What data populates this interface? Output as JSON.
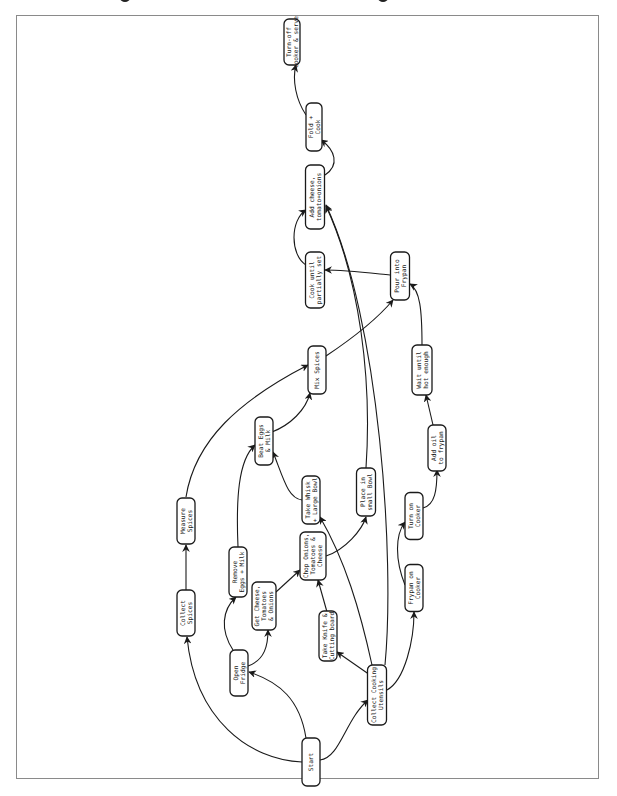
{
  "diagram": {
    "type": "flowchart",
    "orientation": "rotated-90-ccw",
    "title_fragment_visible": false,
    "nodes": [
      {
        "id": "start",
        "label": [
          "Start"
        ],
        "cx": 311,
        "cy": 762,
        "w": 18,
        "h": 48
      },
      {
        "id": "open_fridge",
        "label": [
          "Open",
          "Fridge"
        ],
        "cx": 239,
        "cy": 673,
        "w": 18,
        "h": 46
      },
      {
        "id": "collect_utensils",
        "label": [
          "Collect Cooking",
          "Utensils"
        ],
        "cx": 377,
        "cy": 695,
        "w": 19,
        "h": 60
      },
      {
        "id": "collect_spices",
        "label": [
          "Collect",
          "Spices"
        ],
        "cx": 186,
        "cy": 613,
        "w": 18,
        "h": 46
      },
      {
        "id": "measure_spices",
        "label": [
          "Measure",
          "Spices"
        ],
        "cx": 186,
        "cy": 521,
        "w": 18,
        "h": 46
      },
      {
        "id": "remove_eggs",
        "label": [
          "Remove",
          "Eggs + Milk"
        ],
        "cx": 238,
        "cy": 572,
        "w": 18,
        "h": 50
      },
      {
        "id": "get_cheese",
        "label": [
          "Get Cheese,",
          "Tomatoes",
          "& Onions"
        ],
        "cx": 264,
        "cy": 606,
        "w": 24,
        "h": 48
      },
      {
        "id": "take_knife",
        "label": [
          "Take Knife &",
          "Cutting board"
        ],
        "cx": 328,
        "cy": 636,
        "w": 18,
        "h": 50
      },
      {
        "id": "chop",
        "label": [
          "Chop Onions,",
          "Tomatoes &",
          "Cheese"
        ],
        "cx": 313,
        "cy": 556,
        "w": 26,
        "h": 48
      },
      {
        "id": "frypan_on",
        "label": [
          "Frypan on",
          "Cooker"
        ],
        "cx": 414,
        "cy": 588,
        "w": 18,
        "h": 47
      },
      {
        "id": "turn_on",
        "label": [
          "Turn on",
          "Cooker"
        ],
        "cx": 414,
        "cy": 516,
        "w": 18,
        "h": 47
      },
      {
        "id": "take_whisk",
        "label": [
          "Take Whisk",
          "+ Large Bowl"
        ],
        "cx": 311,
        "cy": 500,
        "w": 18,
        "h": 48
      },
      {
        "id": "place_small",
        "label": [
          "Place in",
          "small Bowl"
        ],
        "cx": 366,
        "cy": 492,
        "w": 19,
        "h": 48
      },
      {
        "id": "beat_eggs",
        "label": [
          "Beat Eggs",
          "& Milk"
        ],
        "cx": 264,
        "cy": 441,
        "w": 18,
        "h": 48
      },
      {
        "id": "add_oil",
        "label": [
          "Add oil",
          "to frypan"
        ],
        "cx": 437,
        "cy": 448,
        "w": 18,
        "h": 46
      },
      {
        "id": "mix_spices",
        "label": [
          "Mix Spices"
        ],
        "cx": 317,
        "cy": 370,
        "w": 18,
        "h": 48
      },
      {
        "id": "wait_hot",
        "label": [
          "Wait until",
          "hot enough"
        ],
        "cx": 422,
        "cy": 370,
        "w": 20,
        "h": 50
      },
      {
        "id": "pour",
        "label": [
          "Pour into",
          "Frypan"
        ],
        "cx": 400,
        "cy": 276,
        "w": 19,
        "h": 48
      },
      {
        "id": "cook_partial",
        "label": [
          "Cook until",
          "partially set"
        ],
        "cx": 315,
        "cy": 280,
        "w": 19,
        "h": 56
      },
      {
        "id": "add_cheese",
        "label": [
          "Add cheese,",
          "tomato+onions"
        ],
        "cx": 315,
        "cy": 197,
        "w": 19,
        "h": 64
      },
      {
        "id": "fold_cook",
        "label": [
          "Fold +",
          "Cook"
        ],
        "cx": 314,
        "cy": 127,
        "w": 16,
        "h": 48
      },
      {
        "id": "serve",
        "label": [
          "Turn-off",
          "cooker & serve"
        ],
        "cx": 292,
        "cy": 42,
        "w": 16,
        "h": 46
      }
    ],
    "edges": [
      {
        "from": "start",
        "to": "open_fridge",
        "d": "M306,738 C300,700 280,682 249,672"
      },
      {
        "from": "start",
        "to": "collect_utensils",
        "d": "M320,760 C340,758 345,720 368,700"
      },
      {
        "from": "start",
        "to": "collect_spices",
        "d": "M302,762 C250,760 195,720 187,637"
      },
      {
        "from": "open_fridge",
        "to": "remove_eggs",
        "d": "M233,650 C220,630 222,610 236,597"
      },
      {
        "from": "open_fridge",
        "to": "get_cheese",
        "d": "M248,666 C265,660 268,645 268,630"
      },
      {
        "from": "collect_spices",
        "to": "measure_spices",
        "d": "M186,590 L186,545"
      },
      {
        "from": "measure_spices",
        "to": "mix_spices",
        "d": "M186,497 C195,440 240,400 308,365"
      },
      {
        "from": "remove_eggs",
        "to": "beat_eggs",
        "d": "M238,547 C236,500 238,460 255,445"
      },
      {
        "from": "get_cheese",
        "to": "chop",
        "d": "M276,592 L300,570"
      },
      {
        "from": "take_knife",
        "to": "chop",
        "d": "M327,612 L318,580"
      },
      {
        "from": "collect_utensils",
        "to": "take_knife",
        "d": "M370,675 L337,652"
      },
      {
        "from": "collect_utensils",
        "to": "take_whisk",
        "d": "M372,665 C360,610 345,560 320,517"
      },
      {
        "from": "collect_utensils",
        "to": "frypan_on",
        "d": "M387,690 C405,680 414,640 414,612"
      },
      {
        "from": "collect_utensils",
        "to": "add_cheese",
        "d": "M385,665 C395,560 380,320 326,205"
      },
      {
        "from": "chop",
        "to": "place_small",
        "d": "M326,556 C345,550 362,530 366,517"
      },
      {
        "from": "take_whisk",
        "to": "beat_eggs",
        "d": "M302,500 C288,498 284,480 273,452"
      },
      {
        "from": "beat_eggs",
        "to": "mix_spices",
        "d": "M272,432 C290,425 306,410 310,393"
      },
      {
        "from": "mix_spices",
        "to": "pour",
        "d": "M326,356 C350,340 378,318 393,300"
      },
      {
        "from": "frypan_on",
        "to": "turn_on",
        "d": "M405,585 C395,560 395,535 405,522"
      },
      {
        "from": "turn_on",
        "to": "add_oil",
        "d": "M423,508 C435,505 437,490 437,470"
      },
      {
        "from": "add_oil",
        "to": "wait_hot",
        "d": "M433,425 L426,395"
      },
      {
        "from": "wait_hot",
        "to": "pour",
        "d": "M422,345 C422,310 420,290 410,284"
      },
      {
        "from": "pour",
        "to": "cook_partial",
        "d": "M390,275 C370,273 345,270 325,270"
      },
      {
        "from": "cook_partial",
        "to": "add_cheese",
        "d": "M306,265 C290,255 290,220 306,210"
      },
      {
        "from": "place_small",
        "to": "add_cheese",
        "d": "M366,468 C372,380 360,280 326,206"
      },
      {
        "from": "add_cheese",
        "to": "fold_cook",
        "d": "M325,175 C340,165 335,150 321,140"
      },
      {
        "from": "fold_cook",
        "to": "serve",
        "d": "M306,115 C296,100 292,80 296,65"
      }
    ]
  }
}
